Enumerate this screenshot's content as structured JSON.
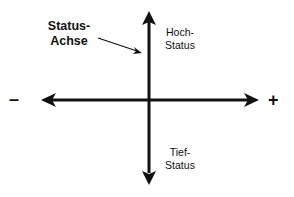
{
  "diagram": {
    "axis_title": "Status-\nAchse",
    "vertical_axis": {
      "top_label": "Hoch-\nStatus",
      "bottom_label": "Tief-\nStatus"
    },
    "horizontal_axis": {
      "negative_label": "–",
      "positive_label": "+"
    },
    "colors": {
      "stroke": "#111111",
      "background": "#ffffff"
    }
  }
}
